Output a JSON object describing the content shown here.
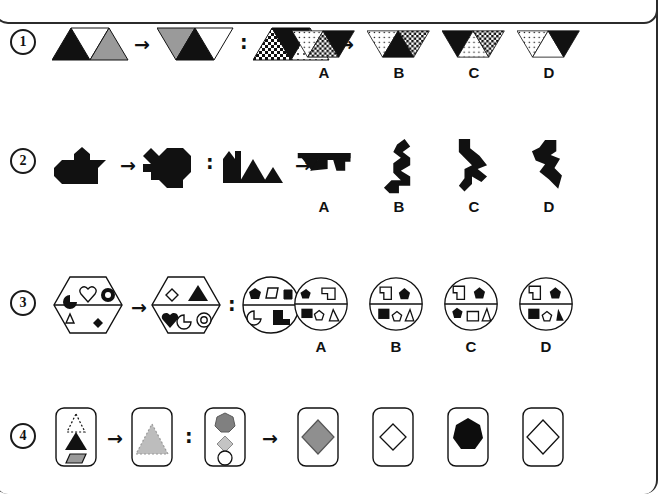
{
  "page": {
    "frame": true,
    "background_color": "#ffffff",
    "ink_color": "#111111",
    "grey_fill": "#9a9a9a",
    "black_fill": "#111111",
    "white_fill": "#ffffff"
  },
  "symbols": {
    "arrow": "→",
    "colon": ":"
  },
  "option_letters": [
    "A",
    "B",
    "C",
    "D"
  ],
  "rows": [
    {
      "number": "1",
      "number_label": "1",
      "theme": "triangle-strips",
      "prompt": {
        "term_a": "three-triangle-strip-black-white-grey",
        "term_b": "three-triangle-strip-rotated-grey-black-white",
        "term_c": "three-triangle-strip-checker-black-dotted",
        "term_d": "unknown"
      },
      "options": [
        {
          "letter": "A",
          "name": "triangle-strip-dotted-checker-black"
        },
        {
          "letter": "B",
          "name": "triangle-strip-dotted-black-checker"
        },
        {
          "letter": "C",
          "name": "triangle-strip-black-dotted-checker"
        },
        {
          "letter": "D",
          "name": "triangle-strip-dotted-white-black"
        }
      ]
    },
    {
      "number": "2",
      "number_label": "2",
      "theme": "black-silhouettes",
      "prompt": {
        "term_a": "duck-silhouette",
        "term_b": "duck-silhouette-rotated",
        "term_c": "mountain-silhouette",
        "term_d": "unknown"
      },
      "options": [
        {
          "letter": "A",
          "name": "mountain-silhouette-flipped"
        },
        {
          "letter": "B",
          "name": "mountain-silhouette-rotated-90"
        },
        {
          "letter": "C",
          "name": "mountain-silhouette-rotated-90-alt"
        },
        {
          "letter": "D",
          "name": "mountain-silhouette-rotated-diagonal"
        }
      ]
    },
    {
      "number": "3",
      "number_label": "3",
      "theme": "hexagon-and-circle-shape-sets",
      "prompt": {
        "term_a": "hexagon-with-six-small-shapes",
        "term_b": "hexagon-rotated-with-six-small-shapes",
        "term_c": "circle-with-six-small-shapes",
        "term_d": "unknown"
      },
      "options": [
        {
          "letter": "A",
          "name": "circle-shape-set-variant-a"
        },
        {
          "letter": "B",
          "name": "circle-shape-set-variant-b"
        },
        {
          "letter": "C",
          "name": "circle-shape-set-variant-c"
        },
        {
          "letter": "D",
          "name": "circle-shape-set-variant-d"
        }
      ]
    },
    {
      "number": "4",
      "number_label": "4",
      "theme": "rounded-cards",
      "prompt": {
        "term_a": "card-dotted-triangle-black-triangle-grey-parallelogram",
        "term_b": "card-dotted-grey-triangle",
        "term_c": "card-grey-heptagon-grey-diamond-white-circle",
        "term_d": "unknown"
      },
      "options": [
        {
          "letter": "A",
          "name": "card-grey-diamond"
        },
        {
          "letter": "B",
          "name": "card-small-white-diamond"
        },
        {
          "letter": "C",
          "name": "card-black-heptagon"
        },
        {
          "letter": "D",
          "name": "card-large-white-diamond"
        }
      ]
    }
  ]
}
